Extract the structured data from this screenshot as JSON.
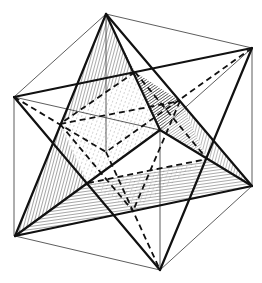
{
  "figure": {
    "background": "#ffffff",
    "ink": "#1a1a1a",
    "cube_vertices": {
      "a": [
        106,
        14
      ],
      "b": [
        252,
        48
      ],
      "c": [
        14,
        97
      ],
      "d": [
        160,
        130
      ],
      "e": [
        106,
        152
      ],
      "f": [
        252,
        186
      ],
      "g": [
        15,
        236
      ],
      "h": [
        160,
        270
      ]
    },
    "octahedron_vertices": {
      "o1": [
        135,
        72
      ],
      "o2": [
        60,
        124
      ],
      "o3": [
        180,
        101
      ],
      "o4": [
        207,
        159
      ],
      "o5": [
        88,
        183
      ],
      "o6": [
        133,
        211
      ]
    }
  }
}
